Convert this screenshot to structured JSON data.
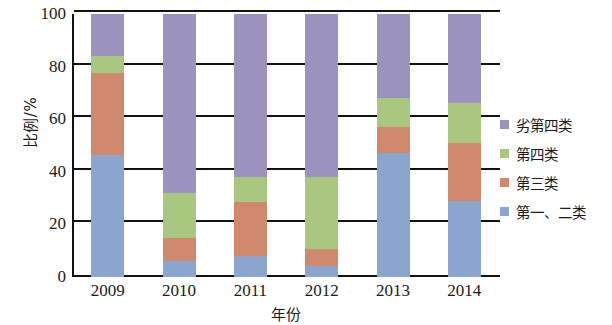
{
  "chart_data": {
    "type": "bar",
    "stacked": true,
    "stacked_mode": "percent",
    "title": "",
    "xlabel": "年份",
    "ylabel": "比例/%",
    "categories": [
      "2009",
      "2010",
      "2011",
      "2012",
      "2013",
      "2014"
    ],
    "ylim": [
      0,
      100
    ],
    "yticks": [
      0,
      20,
      40,
      60,
      80,
      100
    ],
    "ytick_labels": [
      "0",
      "20",
      "40",
      "60",
      "80",
      "100"
    ],
    "grid": true,
    "legend_position": "right",
    "series": [
      {
        "name": "第一、二类",
        "color": "#8ba6ce",
        "values": [
          46.5,
          6.0,
          8.0,
          4.0,
          47.0,
          29.0
        ]
      },
      {
        "name": "第三类",
        "color": "#cf8a6d",
        "values": [
          31.0,
          9.0,
          20.5,
          6.5,
          10.0,
          22.0
        ]
      },
      {
        "name": "第四类",
        "color": "#a9c77e",
        "values": [
          6.5,
          17.0,
          9.5,
          27.5,
          11.0,
          15.0
        ]
      },
      {
        "name": "劣第四类",
        "color": "#9b92bd",
        "values": [
          16.0,
          68.0,
          62.0,
          62.0,
          32.0,
          34.0
        ]
      }
    ]
  },
  "axes": {
    "y_title": "比例/%",
    "x_title": "年份",
    "y_tick_labels": [
      "100",
      "80",
      "60",
      "40",
      "20",
      "0"
    ],
    "x_tick_labels": [
      "2009",
      "2010",
      "2011",
      "2012",
      "2013",
      "2014"
    ]
  },
  "legend": {
    "items": [
      {
        "label": "劣第四类",
        "color": "#9b92bd"
      },
      {
        "label": "第四类",
        "color": "#a9c77e"
      },
      {
        "label": "第三类",
        "color": "#cf8a6d"
      },
      {
        "label": "第一、二类",
        "color": "#8ba6ce"
      }
    ]
  },
  "colors": {
    "axis": "#111111",
    "background": "#ffffff",
    "class_1_2": "#8ba6ce",
    "class_3": "#cf8a6d",
    "class_4": "#a9c77e",
    "class_worse_4": "#9b92bd"
  }
}
